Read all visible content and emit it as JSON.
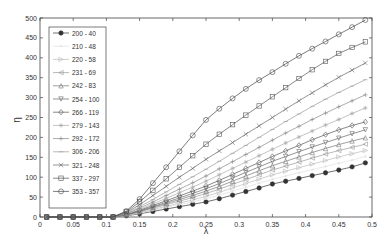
{
  "chart_data": {
    "type": "line",
    "title": "",
    "xlabel": "λ",
    "ylabel": "η",
    "xlim": [
      0,
      0.5
    ],
    "ylim": [
      0,
      500
    ],
    "xticks": [
      0,
      0.05,
      0.1,
      0.15,
      0.2,
      0.25,
      0.3,
      0.35,
      0.4,
      0.45,
      0.5
    ],
    "xtick_labels": [
      "0",
      "0.05",
      "0.1",
      "0.15",
      "0.2",
      "0.25",
      "0.3",
      "0.35",
      "0.4",
      "0.45",
      "0.5"
    ],
    "yticks": [
      0,
      50,
      100,
      150,
      200,
      250,
      300,
      350,
      400,
      450,
      500
    ],
    "ytick_labels": [
      "0",
      "50",
      "100",
      "150",
      "200",
      "250",
      "300",
      "350",
      "400",
      "450",
      "500"
    ],
    "grid": false,
    "legend_position": "upper left",
    "x": [
      0.01,
      0.03,
      0.05,
      0.07,
      0.09,
      0.11,
      0.13,
      0.15,
      0.17,
      0.19,
      0.21,
      0.23,
      0.25,
      0.27,
      0.29,
      0.31,
      0.33,
      0.35,
      0.37,
      0.39,
      0.41,
      0.43,
      0.45,
      0.47,
      0.49
    ],
    "series": [
      {
        "name": "200 - 40",
        "marker": "circle-filled",
        "color": "#333333",
        "values": [
          0,
          0,
          0,
          0,
          0,
          0,
          3,
          8,
          14,
          20,
          26,
          32,
          38,
          46,
          55,
          64,
          73,
          83,
          90,
          97,
          104,
          111,
          118,
          126,
          136
        ]
      },
      {
        "name": "210 - 48",
        "marker": "point",
        "color": "#e0e0e0",
        "values": [
          0,
          0,
          0,
          0,
          0,
          0,
          4,
          10,
          17,
          24,
          31,
          38,
          46,
          55,
          65,
          75,
          85,
          95,
          103,
          111,
          119,
          127,
          135,
          143,
          152
        ]
      },
      {
        "name": "220 - 58",
        "marker": "triangle-right",
        "color": "#bbbbbb",
        "values": [
          0,
          0,
          0,
          0,
          0,
          0,
          4,
          11,
          19,
          27,
          35,
          43,
          52,
          62,
          73,
          84,
          95,
          106,
          115,
          124,
          133,
          142,
          151,
          159,
          167
        ]
      },
      {
        "name": "231 - 69",
        "marker": "triangle-left",
        "color": "#999999",
        "values": [
          0,
          0,
          0,
          0,
          0,
          0,
          5,
          13,
          22,
          31,
          40,
          49,
          59,
          70,
          82,
          94,
          106,
          118,
          128,
          138,
          148,
          158,
          167,
          175,
          183
        ]
      },
      {
        "name": "242 - 83",
        "marker": "triangle-up",
        "color": "#777777",
        "values": [
          0,
          0,
          0,
          0,
          0,
          0,
          5,
          14,
          24,
          34,
          44,
          54,
          65,
          77,
          90,
          103,
          116,
          129,
          140,
          151,
          162,
          172,
          182,
          191,
          199
        ]
      },
      {
        "name": "254 - 100",
        "marker": "triangle-down",
        "color": "#666666",
        "values": [
          0,
          0,
          0,
          0,
          0,
          0,
          6,
          15,
          26,
          37,
          48,
          59,
          71,
          84,
          98,
          112,
          126,
          140,
          152,
          164,
          176,
          187,
          198,
          209,
          219
        ]
      },
      {
        "name": "266 - 119",
        "marker": "diamond",
        "color": "#555555",
        "values": [
          0,
          0,
          0,
          0,
          0,
          0,
          6,
          17,
          29,
          41,
          53,
          65,
          78,
          92,
          107,
          122,
          137,
          152,
          166,
          180,
          194,
          207,
          219,
          230,
          239
        ]
      },
      {
        "name": "279 - 143",
        "marker": "asterisk",
        "color": "#aaaaaa",
        "values": [
          0,
          0,
          0,
          0,
          0,
          0,
          7,
          19,
          33,
          47,
          61,
          75,
          90,
          106,
          122,
          138,
          154,
          170,
          186,
          201,
          216,
          231,
          245,
          260,
          274
        ]
      },
      {
        "name": "292 - 172",
        "marker": "plus",
        "color": "#888888",
        "values": [
          0,
          0,
          0,
          0,
          0,
          0,
          8,
          22,
          38,
          54,
          70,
          86,
          103,
          121,
          139,
          157,
          175,
          193,
          211,
          228,
          245,
          261,
          277,
          292,
          307
        ]
      },
      {
        "name": "306 - 206",
        "marker": "dash",
        "color": "#999999",
        "values": [
          0,
          0,
          0,
          0,
          0,
          0,
          9,
          26,
          44,
          63,
          82,
          101,
          120,
          140,
          160,
          180,
          200,
          220,
          240,
          259,
          278,
          296,
          313,
          329,
          345
        ]
      },
      {
        "name": "321 - 248",
        "marker": "x",
        "color": "#666666",
        "values": [
          0,
          0,
          0,
          0,
          0,
          0,
          11,
          31,
          54,
          77,
          100,
          122,
          145,
          166,
          187,
          208,
          229,
          250,
          271,
          292,
          312,
          332,
          351,
          369,
          387
        ]
      },
      {
        "name": "337 - 297",
        "marker": "square",
        "color": "#555555",
        "values": [
          0,
          0,
          0,
          0,
          0,
          0,
          13,
          38,
          67,
          96,
          125,
          154,
          183,
          208,
          232,
          256,
          279,
          302,
          325,
          348,
          370,
          391,
          411,
          426,
          440
        ]
      },
      {
        "name": "353 - 357",
        "marker": "circle-open",
        "color": "#444444",
        "values": [
          0,
          0,
          0,
          0,
          0,
          0,
          15,
          45,
          85,
          125,
          165,
          205,
          244,
          272,
          298,
          322,
          344,
          364,
          385,
          405,
          423,
          441,
          459,
          477,
          495
        ]
      }
    ]
  }
}
